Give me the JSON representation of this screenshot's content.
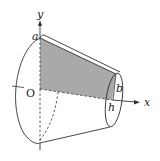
{
  "diagram": {
    "type": "solid-of-revolution (truncated cone / frustum)",
    "labels": {
      "y_axis": "y",
      "x_axis": "x",
      "origin": "O",
      "a": "a",
      "b": "b",
      "h": "h"
    },
    "colors": {
      "line": "#333333",
      "shaded_region": "#a9a9a9",
      "background": "#ffffff"
    }
  }
}
